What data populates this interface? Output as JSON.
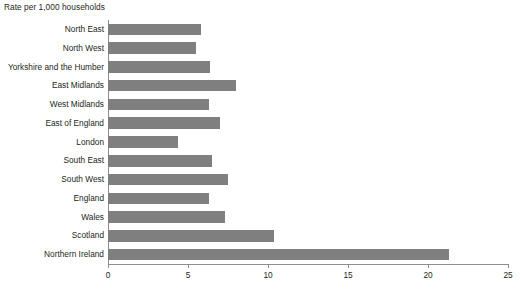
{
  "chart_data": {
    "type": "bar",
    "orientation": "horizontal",
    "title": "Rate per 1,000 households",
    "xlabel": "",
    "ylabel": "",
    "xlim": [
      0,
      25
    ],
    "xticks": [
      0,
      5,
      10,
      15,
      20,
      25
    ],
    "xtick_labels": [
      "0",
      "5",
      "10",
      "15",
      "20",
      "25"
    ],
    "grid": false,
    "legend": null,
    "bar_color": "#7f7f7f",
    "axis_color": "#8d8d8d",
    "text_color": "#231f20",
    "background": "#ffffff",
    "categories": [
      "North East",
      "North West",
      "Yorkshire and the Humber",
      "East Midlands",
      "West Midlands",
      "East of England",
      "London",
      "South East",
      "South West",
      "England",
      "Wales",
      "Scotland",
      "Northern Ireland"
    ],
    "values": [
      5.8,
      5.5,
      6.4,
      8.0,
      6.3,
      7.0,
      4.4,
      6.5,
      7.5,
      6.3,
      7.3,
      10.4,
      21.3
    ]
  }
}
